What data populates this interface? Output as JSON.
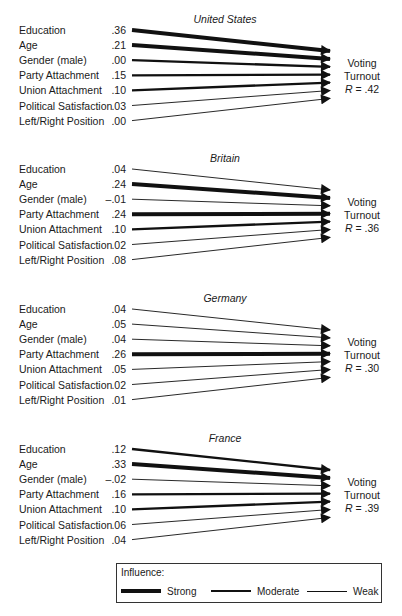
{
  "chart_data": {
    "type": "path-diagram",
    "outcome_label": [
      "Voting",
      "Turnout"
    ],
    "predictors": [
      "Education",
      "Age",
      "Gender (male)",
      "Party Attachment",
      "Union Attachment",
      "Political Satisfaction",
      "Left/Right Position"
    ],
    "panels": [
      {
        "country": "United States",
        "r_label": "R = .42",
        "R": 0.42,
        "coefficients": [
          ".36",
          ".21",
          ".00",
          ".15",
          ".10",
          ".03",
          ".00"
        ],
        "values": [
          0.36,
          0.21,
          0.0,
          0.15,
          0.1,
          0.03,
          0.0
        ],
        "strength": [
          "strong",
          "strong",
          "moderate",
          "moderate",
          "moderate",
          "weak",
          "weak"
        ]
      },
      {
        "country": "Britain",
        "r_label": "R = .36",
        "R": 0.36,
        "coefficients": [
          ".04",
          ".24",
          "–.01",
          ".24",
          ".10",
          ".02",
          ".08"
        ],
        "values": [
          0.04,
          0.24,
          -0.01,
          0.24,
          0.1,
          0.02,
          0.08
        ],
        "strength": [
          "weak",
          "strong",
          "weak",
          "strong",
          "moderate",
          "weak",
          "weak"
        ]
      },
      {
        "country": "Germany",
        "r_label": "R = .30",
        "R": 0.3,
        "coefficients": [
          ".04",
          ".05",
          ".04",
          ".26",
          ".05",
          ".02",
          ".01"
        ],
        "values": [
          0.04,
          0.05,
          0.04,
          0.26,
          0.05,
          0.02,
          0.01
        ],
        "strength": [
          "weak",
          "weak",
          "weak",
          "strong",
          "weak",
          "weak",
          "weak"
        ]
      },
      {
        "country": "France",
        "r_label": "R = .39",
        "R": 0.39,
        "coefficients": [
          ".12",
          ".33",
          "–.02",
          ".16",
          ".10",
          ".06",
          ".04"
        ],
        "values": [
          0.12,
          0.33,
          -0.02,
          0.16,
          0.1,
          0.06,
          0.04
        ],
        "strength": [
          "moderate",
          "strong",
          "weak",
          "moderate",
          "moderate",
          "weak",
          "weak"
        ]
      }
    ],
    "legend": {
      "title": "Influence:",
      "items": [
        {
          "label": "Strong",
          "width": 4
        },
        {
          "label": "Moderate",
          "width": 2.2
        },
        {
          "label": "Weak",
          "width": 0.9
        }
      ]
    }
  }
}
